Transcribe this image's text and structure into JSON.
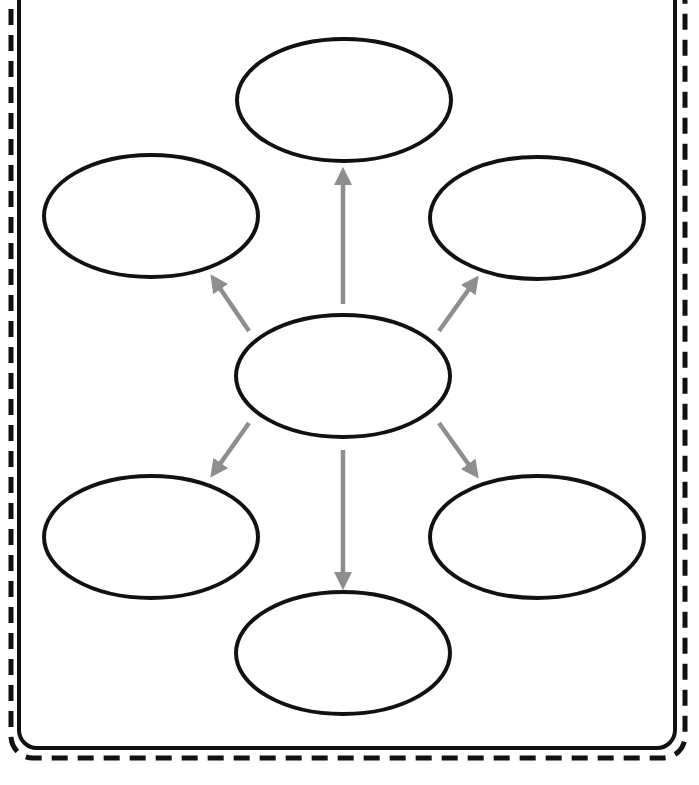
{
  "diagram": {
    "type": "bubble-map-graphic-organizer",
    "colors": {
      "background": "#ffffff",
      "outline": "#111111",
      "arrow": "#8e8e8e",
      "dashed_border": "#111111"
    },
    "frame": {
      "inner": {
        "x": 19,
        "y": -20,
        "w": 656,
        "h": 768,
        "rx": 18,
        "stroke_width": 4
      },
      "outer_dashed": {
        "x": 11,
        "y": -20,
        "w": 674,
        "h": 778,
        "rx": 22,
        "stroke_width": 5,
        "dash": "16 10"
      }
    },
    "center_node": {
      "cx": 343,
      "cy": 376,
      "rx": 107,
      "ry": 61,
      "label": ""
    },
    "outer_nodes": [
      {
        "id": "top",
        "cx": 344,
        "cy": 100,
        "rx": 107,
        "ry": 61,
        "label": ""
      },
      {
        "id": "upper-left",
        "cx": 151,
        "cy": 216,
        "rx": 107,
        "ry": 61,
        "label": ""
      },
      {
        "id": "upper-right",
        "cx": 537,
        "cy": 218,
        "rx": 107,
        "ry": 61,
        "label": ""
      },
      {
        "id": "lower-left",
        "cx": 151,
        "cy": 537,
        "rx": 107,
        "ry": 61,
        "label": ""
      },
      {
        "id": "lower-right",
        "cx": 537,
        "cy": 537,
        "rx": 107,
        "ry": 61,
        "label": ""
      },
      {
        "id": "bottom",
        "cx": 343,
        "cy": 653,
        "rx": 107,
        "ry": 61,
        "label": ""
      }
    ],
    "arrows": [
      {
        "id": "to-top",
        "x1": 343,
        "y1": 304,
        "x2": 343,
        "y2": 175
      },
      {
        "id": "to-upper-left",
        "x1": 249,
        "y1": 331,
        "x2": 215,
        "y2": 281
      },
      {
        "id": "to-upper-right",
        "x1": 439,
        "y1": 331,
        "x2": 474,
        "y2": 282
      },
      {
        "id": "to-lower-left",
        "x1": 249,
        "y1": 423,
        "x2": 215,
        "y2": 471
      },
      {
        "id": "to-lower-right",
        "x1": 439,
        "y1": 423,
        "x2": 474,
        "y2": 472
      },
      {
        "id": "to-bottom",
        "x1": 343,
        "y1": 450,
        "x2": 343,
        "y2": 582
      }
    ]
  }
}
